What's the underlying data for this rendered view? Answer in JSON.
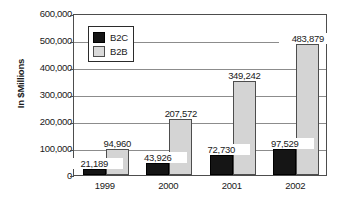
{
  "chart_data": {
    "type": "bar",
    "title": "",
    "subtitle": "",
    "xlabel": "",
    "ylabel": "In $Millions",
    "categories": [
      "1999",
      "2000",
      "2001",
      "2002"
    ],
    "series": [
      {
        "name": "B2C",
        "color": "#151515",
        "values": [
          21189,
          43926,
          72730,
          97529
        ],
        "labels": [
          "21,189",
          "43,926",
          "72,730",
          "97,529"
        ]
      },
      {
        "name": "B2B",
        "color": "#d4d4d4",
        "values": [
          94960,
          207572,
          349242,
          483879
        ],
        "labels": [
          "94,960",
          "207,572",
          "349,242",
          "483,879"
        ]
      }
    ],
    "ylim": [
      0,
      600000
    ],
    "ytick_values": [
      0,
      100000,
      200000,
      300000,
      400000,
      500000,
      600000
    ],
    "ytick_labels": [
      "0",
      "100,000",
      "200,000",
      "300,000",
      "400,000",
      "500,000",
      "600,000"
    ],
    "grid": "horizontal",
    "legend_position": "upper-left-inside",
    "data_labels_shown": true,
    "background_color": "#ffffff",
    "axis_color": "#4d4d4d"
  }
}
